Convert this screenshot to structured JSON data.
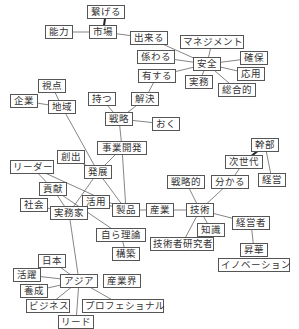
{
  "diagram": {
    "type": "co-occurrence-network",
    "line_color": "#666666",
    "strong_line_color": "#222222",
    "border_color": "#555555",
    "nodes": [
      {
        "id": "tsunageru",
        "label": "繋げる",
        "x": 87,
        "y": 5,
        "w": 38
      },
      {
        "id": "shijou",
        "label": "市場",
        "x": 89,
        "y": 25,
        "w": 28
      },
      {
        "id": "nouryoku",
        "label": "能力",
        "x": 45,
        "y": 25,
        "w": 28
      },
      {
        "id": "dekiru",
        "label": "出来る",
        "x": 130,
        "y": 31,
        "w": 38
      },
      {
        "id": "management",
        "label": "マネジメント",
        "x": 180,
        "y": 35,
        "w": 64
      },
      {
        "id": "kakawaru",
        "label": "係わる",
        "x": 137,
        "y": 50,
        "w": 38
      },
      {
        "id": "anzen",
        "label": "安全",
        "x": 193,
        "y": 57,
        "w": 28
      },
      {
        "id": "kakuho",
        "label": "確保",
        "x": 240,
        "y": 51,
        "w": 28
      },
      {
        "id": "yuusuru",
        "label": "有する",
        "x": 138,
        "y": 69,
        "w": 38
      },
      {
        "id": "jitsumu",
        "label": "実務",
        "x": 185,
        "y": 75,
        "w": 28
      },
      {
        "id": "ouyou",
        "label": "応用",
        "x": 237,
        "y": 67,
        "w": 28
      },
      {
        "id": "sougouteki",
        "label": "総合的",
        "x": 218,
        "y": 83,
        "w": 38
      },
      {
        "id": "shiten",
        "label": "視点",
        "x": 38,
        "y": 79,
        "w": 28
      },
      {
        "id": "kigyou",
        "label": "企業",
        "x": 10,
        "y": 94,
        "w": 28
      },
      {
        "id": "chiiki",
        "label": "地域",
        "x": 48,
        "y": 100,
        "w": 28
      },
      {
        "id": "motsu",
        "label": "持つ",
        "x": 88,
        "y": 92,
        "w": 28
      },
      {
        "id": "kaiketsu",
        "label": "解決",
        "x": 131,
        "y": 92,
        "w": 28
      },
      {
        "id": "senryaku",
        "label": "戦略",
        "x": 105,
        "y": 112,
        "w": 28
      },
      {
        "id": "oku",
        "label": "おく",
        "x": 152,
        "y": 117,
        "w": 28
      },
      {
        "id": "jigyoukaihatsu",
        "label": "事業開発",
        "x": 97,
        "y": 141,
        "w": 50
      },
      {
        "id": "kanbu",
        "label": "幹部",
        "x": 251,
        "y": 138,
        "w": 28
      },
      {
        "id": "soushutsu",
        "label": "創出",
        "x": 57,
        "y": 150,
        "w": 28
      },
      {
        "id": "leader",
        "label": "リーダー",
        "x": 10,
        "y": 160,
        "w": 44
      },
      {
        "id": "hatten",
        "label": "発展",
        "x": 84,
        "y": 165,
        "w": 28
      },
      {
        "id": "jisedai",
        "label": "次世代",
        "x": 225,
        "y": 155,
        "w": 38
      },
      {
        "id": "keiei",
        "label": "経営",
        "x": 258,
        "y": 173,
        "w": 28
      },
      {
        "id": "senryakuteki",
        "label": "戦略的",
        "x": 167,
        "y": 175,
        "w": 38
      },
      {
        "id": "wakaru",
        "label": "分かる",
        "x": 211,
        "y": 175,
        "w": 38
      },
      {
        "id": "kouken",
        "label": "貢献",
        "x": 39,
        "y": 182,
        "w": 28
      },
      {
        "id": "katsuyou",
        "label": "活用",
        "x": 82,
        "y": 195,
        "w": 28
      },
      {
        "id": "shakai",
        "label": "社会",
        "x": 20,
        "y": 198,
        "w": 28
      },
      {
        "id": "seihin",
        "label": "製品",
        "x": 112,
        "y": 203,
        "w": 28
      },
      {
        "id": "sangyou",
        "label": "産業",
        "x": 146,
        "y": 203,
        "w": 28
      },
      {
        "id": "gijutsu",
        "label": "技術",
        "x": 186,
        "y": 203,
        "w": 28
      },
      {
        "id": "jitsumuka",
        "label": "実務家",
        "x": 50,
        "y": 206,
        "w": 38
      },
      {
        "id": "keieisha",
        "label": "経営者",
        "x": 232,
        "y": 216,
        "w": 38
      },
      {
        "id": "chishiki",
        "label": "知識",
        "x": 197,
        "y": 223,
        "w": 28
      },
      {
        "id": "jirariron",
        "label": "自ら理論",
        "x": 96,
        "y": 228,
        "w": 50
      },
      {
        "id": "gijutsushakenkyusha",
        "label": "技術者研究者",
        "x": 150,
        "y": 237,
        "w": 64
      },
      {
        "id": "kouchiku",
        "label": "構築",
        "x": 112,
        "y": 247,
        "w": 28
      },
      {
        "id": "shouka",
        "label": "昇華",
        "x": 240,
        "y": 243,
        "w": 28
      },
      {
        "id": "innovation",
        "label": "イノベーション",
        "x": 218,
        "y": 258,
        "w": 72
      },
      {
        "id": "nihon",
        "label": "日本",
        "x": 38,
        "y": 254,
        "w": 28
      },
      {
        "id": "katsuyaku",
        "label": "活躍",
        "x": 13,
        "y": 268,
        "w": 28
      },
      {
        "id": "asia",
        "label": "アジア",
        "x": 60,
        "y": 274,
        "w": 38
      },
      {
        "id": "sangyoukai",
        "label": "産業界",
        "x": 103,
        "y": 274,
        "w": 38
      },
      {
        "id": "yousei",
        "label": "養成",
        "x": 20,
        "y": 284,
        "w": 28
      },
      {
        "id": "business",
        "label": "ビジネス",
        "x": 26,
        "y": 299,
        "w": 44
      },
      {
        "id": "professional",
        "label": "プロフェショナル",
        "x": 82,
        "y": 299,
        "w": 82
      },
      {
        "id": "lead",
        "label": "リード",
        "x": 58,
        "y": 315,
        "w": 36
      }
    ],
    "edges": [
      {
        "from": "tsunageru",
        "to": "shijou",
        "strong": true
      },
      {
        "from": "nouryoku",
        "to": "shijou"
      },
      {
        "from": "shijou",
        "to": "dekiru"
      },
      {
        "from": "dekiru",
        "to": "anzen"
      },
      {
        "from": "kakawaru",
        "to": "anzen"
      },
      {
        "from": "management",
        "to": "anzen"
      },
      {
        "from": "anzen",
        "to": "kakuho"
      },
      {
        "from": "anzen",
        "to": "ouyou"
      },
      {
        "from": "anzen",
        "to": "yuusuru"
      },
      {
        "from": "anzen",
        "to": "jitsumu"
      },
      {
        "from": "anzen",
        "to": "sougouteki"
      },
      {
        "from": "yuusuru",
        "to": "kaiketsu"
      },
      {
        "from": "shiten",
        "to": "chiiki"
      },
      {
        "from": "kigyou",
        "to": "chiiki"
      },
      {
        "from": "chiiki",
        "to": "hatten"
      },
      {
        "from": "motsu",
        "to": "senryaku"
      },
      {
        "from": "kaiketsu",
        "to": "senryaku"
      },
      {
        "from": "senryaku",
        "to": "oku"
      },
      {
        "from": "senryaku",
        "to": "jigyoukaihatsu"
      },
      {
        "from": "jigyoukaihatsu",
        "to": "hatten"
      },
      {
        "from": "jigyoukaihatsu",
        "to": "seihin"
      },
      {
        "from": "soushutsu",
        "to": "hatten"
      },
      {
        "from": "leader",
        "to": "kouken"
      },
      {
        "from": "leader",
        "to": "seihin"
      },
      {
        "from": "hatten",
        "to": "seihin"
      },
      {
        "from": "hatten",
        "to": "jitsumuka"
      },
      {
        "from": "kouken",
        "to": "jitsumuka"
      },
      {
        "from": "kouken",
        "to": "jirariron"
      },
      {
        "from": "shakai",
        "to": "jitsumuka"
      },
      {
        "from": "katsuyou",
        "to": "seihin"
      },
      {
        "from": "katsuyou",
        "to": "jitsumuka"
      },
      {
        "from": "seihin",
        "to": "sangyou"
      },
      {
        "from": "sangyou",
        "to": "gijutsu"
      },
      {
        "from": "gijutsu",
        "to": "senryakuteki"
      },
      {
        "from": "gijutsu",
        "to": "wakaru"
      },
      {
        "from": "gijutsu",
        "to": "chishiki"
      },
      {
        "from": "gijutsu",
        "to": "keieisha"
      },
      {
        "from": "gijutsu",
        "to": "gijutsushakenkyusha"
      },
      {
        "from": "wakaru",
        "to": "jisedai"
      },
      {
        "from": "jisedai",
        "to": "kanbu",
        "strong": true
      },
      {
        "from": "kanbu",
        "to": "keiei"
      },
      {
        "from": "keieisha",
        "to": "shouka"
      },
      {
        "from": "jirariron",
        "to": "kouchiku"
      },
      {
        "from": "jitsumuka",
        "to": "asia"
      },
      {
        "from": "nihon",
        "to": "asia"
      },
      {
        "from": "katsuyaku",
        "to": "asia"
      },
      {
        "from": "yousei",
        "to": "asia"
      },
      {
        "from": "asia",
        "to": "business"
      },
      {
        "from": "asia",
        "to": "professional"
      },
      {
        "from": "asia",
        "to": "lead"
      }
    ]
  }
}
